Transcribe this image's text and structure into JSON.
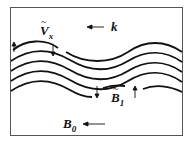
{
  "diagram": {
    "labels": {
      "velocity": "V",
      "velocity_sub": "x",
      "wavevector": "k",
      "perturbed_field": "B",
      "perturbed_field_sub": "1",
      "background_field": "B",
      "background_field_sub": "0"
    },
    "wave_lines": 5,
    "colors": {
      "line": "#111111",
      "border": "#555555",
      "background": "#ffffff"
    }
  }
}
